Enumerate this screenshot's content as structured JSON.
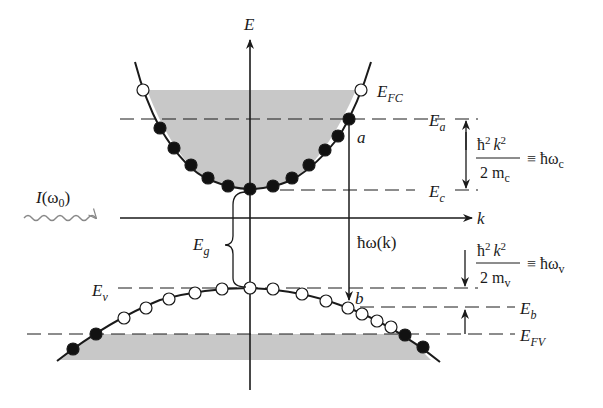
{
  "diagram": {
    "axes": {
      "energy_axis_label": "E",
      "k_axis_label": "k"
    },
    "incident_light": {
      "label_I": "I",
      "label_omega": "(ω",
      "label_sub": "0",
      "label_close": ")"
    },
    "levels": {
      "E_FC": {
        "main": "E",
        "sub": "FC"
      },
      "E_a": {
        "main": "E",
        "sub": "a"
      },
      "E_c": {
        "main": "E",
        "sub": "c"
      },
      "E_v": {
        "main": "E",
        "sub": "v"
      },
      "E_b": {
        "main": "E",
        "sub": "b"
      },
      "E_FV": {
        "main": "E",
        "sub": "FV"
      },
      "E_g": {
        "main": "E",
        "sub": "g"
      }
    },
    "points": {
      "a": "a",
      "b": "b"
    },
    "transition": {
      "label": "ħω(k)"
    },
    "conduction_energy": {
      "numerator": "ħ",
      "num_sup1": "2",
      "num_k": "k",
      "num_sup2": "2",
      "denominator": "2 m",
      "den_sub": "c",
      "equiv": "≡ ħω",
      "equiv_sub": "c"
    },
    "valence_energy": {
      "numerator": "ħ",
      "num_sup1": "2",
      "num_k": "k",
      "num_sup2": "2",
      "denominator": "2 m",
      "den_sub": "v",
      "equiv": "≡ ħω",
      "equiv_sub": "v"
    },
    "legend_semantics": {
      "filled_dot": "occupied state (electron)",
      "open_dot": "empty state (hole)",
      "shaded_region": "filled states"
    },
    "colors": {
      "line": "#1a1a1a",
      "shade": "#c8c8c8",
      "dot_filled": "#111111",
      "dot_open": "#ffffff",
      "wave": "#888888"
    }
  }
}
